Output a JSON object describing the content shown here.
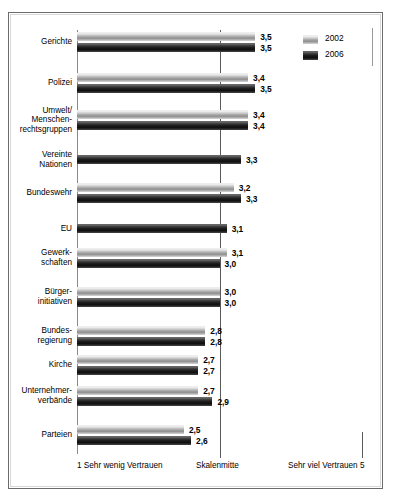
{
  "legend": {
    "items": [
      {
        "label": "2002",
        "key": "y2002",
        "color": "#b5b5b5"
      },
      {
        "label": "2006",
        "key": "y2006",
        "color": "#1b1b1b"
      }
    ]
  },
  "axis": {
    "low_label": "1  Sehr wenig Vertrauen",
    "mid_label": "Skalenmitte",
    "high_label": "Sehr viel Vertrauen  5",
    "min": 1,
    "max": 5,
    "mid": 3
  },
  "chart_data": {
    "type": "bar",
    "orientation": "horizontal",
    "title": "",
    "subtitle": "",
    "xlabel": "",
    "ylabel": "",
    "xlim": [
      1,
      5
    ],
    "grid": false,
    "legend_position": "top-right",
    "categories": [
      "Gerichte",
      "Polizei",
      "Umwelt/ Menschen- rechtsgruppen",
      "Vereinte Nationen",
      "Bundeswehr",
      "EU",
      "Gewerk- schaften",
      "Bürger- initiativen",
      "Bundes- regierung",
      "Kirche",
      "Unternehmer- verbände",
      "Parteien"
    ],
    "series": [
      {
        "name": "2002",
        "values": [
          3.5,
          3.4,
          3.4,
          null,
          3.2,
          null,
          3.1,
          3.0,
          2.8,
          2.7,
          2.7,
          2.5
        ],
        "labels": [
          "3,5",
          "3,4",
          "3,4",
          null,
          "3,2",
          null,
          "3,1",
          "3,0",
          "2,8",
          "2,7",
          "2,7",
          "2,5"
        ]
      },
      {
        "name": "2006",
        "values": [
          3.5,
          3.5,
          3.4,
          3.3,
          3.3,
          3.1,
          3.0,
          3.0,
          2.8,
          2.7,
          2.9,
          2.6
        ],
        "labels": [
          "3,5",
          "3,5",
          "3,4",
          "3,3",
          "3,3",
          "3,1",
          "3,0",
          "3,0",
          "2,8",
          "2,7",
          "2,9",
          "2,6"
        ]
      }
    ],
    "category_lines": [
      [
        "Gerichte"
      ],
      [
        "Polizei"
      ],
      [
        "Umwelt/",
        "Menschen-",
        "rechtsgruppen"
      ],
      [
        "Vereinte",
        "Nationen"
      ],
      [
        "Bundeswehr"
      ],
      [
        "EU"
      ],
      [
        "Gewerk-",
        "schaften"
      ],
      [
        "Bürger-",
        "initiativen"
      ],
      [
        "Bundes-",
        "regierung"
      ],
      [
        "Kirche"
      ],
      [
        "Unternehmer-",
        "verbände"
      ],
      [
        "Parteien"
      ]
    ]
  }
}
